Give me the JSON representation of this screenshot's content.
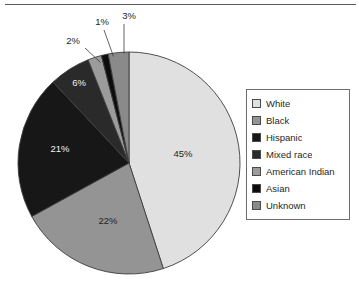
{
  "chart_data": {
    "type": "pie",
    "title": "",
    "legend_position": "right",
    "categories": [
      "White",
      "Black",
      "Hispanic",
      "Mixed race",
      "American Indian",
      "Asian",
      "Unknown"
    ],
    "values": [
      45,
      22,
      21,
      6,
      2,
      1,
      3
    ],
    "value_labels": [
      "45%",
      "22%",
      "21%",
      "6%",
      "2%",
      "1%",
      "3%"
    ],
    "colors": [
      "#e0e0e0",
      "#949494",
      "#171717",
      "#2a2a2a",
      "#9c9c9c",
      "#0d0d0d",
      "#8a8a8a"
    ],
    "label_placement": [
      "inside",
      "inside",
      "inside",
      "inside",
      "outside",
      "outside",
      "outside"
    ],
    "start_angle_deg": 0,
    "direction": "clockwise",
    "slices": [
      {
        "name": "White",
        "value": 45,
        "label": "45%",
        "color": "#e0e0e0",
        "label_color": "dark",
        "placement": "inside"
      },
      {
        "name": "Black",
        "value": 22,
        "label": "22%",
        "color": "#949494",
        "label_color": "dark",
        "placement": "inside"
      },
      {
        "name": "Hispanic",
        "value": 21,
        "label": "21%",
        "color": "#171717",
        "label_color": "light",
        "placement": "inside"
      },
      {
        "name": "Mixed race",
        "value": 6,
        "label": "6%",
        "color": "#2a2a2a",
        "label_color": "light",
        "placement": "inside"
      },
      {
        "name": "American Indian",
        "value": 2,
        "label": "2%",
        "color": "#9c9c9c",
        "label_color": "dark",
        "placement": "outside"
      },
      {
        "name": "Asian",
        "value": 1,
        "label": "1%",
        "color": "#0d0d0d",
        "label_color": "dark",
        "placement": "outside"
      },
      {
        "name": "Unknown",
        "value": 3,
        "label": "3%",
        "color": "#8a8a8a",
        "label_color": "dark",
        "placement": "outside"
      }
    ]
  },
  "pie": {
    "label_45": "45%",
    "label_22": "22%",
    "label_21": "21%",
    "label_6": "6%",
    "label_2": "2%",
    "label_1": "1%",
    "label_3": "3%"
  },
  "legend": {
    "items": [
      {
        "label": "White",
        "color": "#e0e0e0"
      },
      {
        "label": "Black",
        "color": "#949494"
      },
      {
        "label": "Hispanic",
        "color": "#171717"
      },
      {
        "label": "Mixed race",
        "color": "#2a2a2a"
      },
      {
        "label": "American Indian",
        "color": "#9c9c9c"
      },
      {
        "label": "Asian",
        "color": "#0d0d0d"
      },
      {
        "label": "Unknown",
        "color": "#8a8a8a"
      }
    ]
  }
}
